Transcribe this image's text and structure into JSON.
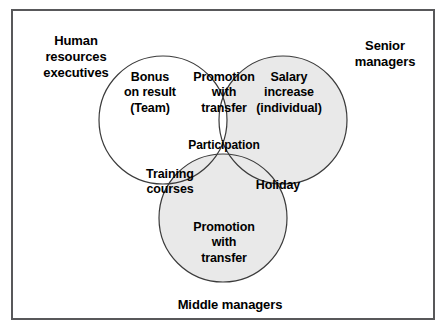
{
  "diagram": {
    "type": "venn-3-circle",
    "frame": {
      "border_color": "#58585a",
      "background_color": "#ffffff"
    },
    "colors": {
      "circle_stroke": "#3b3b3b",
      "fill_white": "#ffffff",
      "fill_light_gray": "#e9e9e9",
      "fill_mid_gray": "#c9c9c9",
      "text": "#000000"
    },
    "external_labels": [
      {
        "id": "hr",
        "text": "Human\nresources\nexecutives"
      },
      {
        "id": "senior",
        "text": "Senior\nmanagers"
      },
      {
        "id": "middle",
        "text": "Middle managers"
      }
    ],
    "circles": [
      {
        "id": "left",
        "label": "Bonus\non result\n(Team)",
        "belongs_to": "Human resources executives",
        "cx": 163,
        "cy": 120,
        "r": 64,
        "fill": "#ffffff"
      },
      {
        "id": "right",
        "label": "Salary\nincrease\n(individual)",
        "belongs_to": "Senior managers",
        "cx": 283,
        "cy": 120,
        "r": 64,
        "fill": "#e9e9e9"
      },
      {
        "id": "bottom",
        "label": "Promotion\nwith\ntransfer",
        "belongs_to": "Middle managers",
        "cx": 223,
        "cy": 218,
        "r": 64,
        "fill": "#e9e9e9"
      }
    ],
    "intersections": [
      {
        "id": "left-right",
        "sets": [
          "left",
          "right"
        ],
        "label": "Promotion\nwith\ntransfer",
        "fill": "#ffffff"
      },
      {
        "id": "left-bottom",
        "sets": [
          "left",
          "bottom"
        ],
        "label": "Training\ncourses",
        "fill": "#e9e9e9"
      },
      {
        "id": "right-bottom",
        "sets": [
          "right",
          "bottom"
        ],
        "label": "Holiday",
        "fill": "#e9e9e9"
      },
      {
        "id": "center",
        "sets": [
          "left",
          "right",
          "bottom"
        ],
        "label": "Participation",
        "fill": "#c9c9c9"
      }
    ]
  }
}
